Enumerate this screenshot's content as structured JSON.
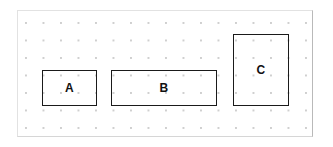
{
  "diagram": {
    "title": "",
    "canvas": {
      "name": "dotted-grid-canvas",
      "background_color": "#ffffff",
      "border_color": "#e2e2e2",
      "grid": {
        "style": "dots",
        "dot_color": "#cfcfcf",
        "spacing_px": 17.5
      }
    },
    "shapes": [
      {
        "id": "a",
        "label": "A",
        "shape": "rectangle",
        "orientation": "landscape",
        "stroke_color": "#1a1a1a",
        "fill_color": "#ffffff",
        "x": 24,
        "y": 59,
        "width": 55,
        "height": 36
      },
      {
        "id": "b",
        "label": "B",
        "shape": "rectangle",
        "orientation": "landscape",
        "stroke_color": "#1a1a1a",
        "fill_color": "#ffffff",
        "x": 93,
        "y": 59,
        "width": 106,
        "height": 36
      },
      {
        "id": "c",
        "label": "C",
        "shape": "rectangle",
        "orientation": "portrait",
        "stroke_color": "#1a1a1a",
        "fill_color": "#ffffff",
        "x": 215,
        "y": 23,
        "width": 56,
        "height": 72
      }
    ]
  }
}
